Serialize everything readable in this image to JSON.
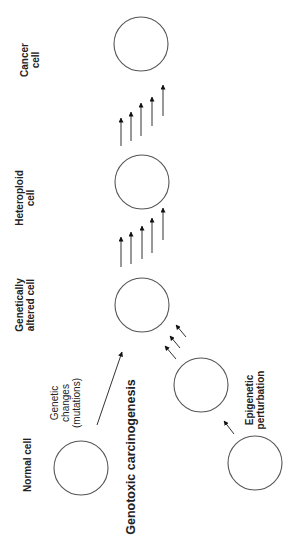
{
  "diagram": {
    "title": "Genotoxic carcinogenesis",
    "cells": [
      {
        "id": "normal",
        "label_lines": [
          "Normal cell"
        ],
        "cx": 81,
        "cy": 468,
        "r": 27
      },
      {
        "id": "genetically-altered",
        "label_lines": [
          "Genetically",
          "altered cell"
        ],
        "cx": 142,
        "cy": 305,
        "r": 27
      },
      {
        "id": "heteroploid",
        "label_lines": [
          "Heteroploid",
          "cell"
        ],
        "cx": 142,
        "cy": 182,
        "r": 27
      },
      {
        "id": "cancer",
        "label_lines": [
          "Cancer",
          "cell"
        ],
        "cx": 141,
        "cy": 44,
        "r": 27
      },
      {
        "id": "epigenetic-intermediate",
        "label_lines": [],
        "cx": 201,
        "cy": 385,
        "r": 27
      },
      {
        "id": "epigenetic-origin",
        "label_lines": [],
        "cx": 255,
        "cy": 463,
        "r": 27
      }
    ],
    "annotations": {
      "genetic_changes": [
        "Genetic",
        "changes",
        "(mutations)"
      ],
      "epigenetic_perturbation": [
        "Epigenetic",
        "perturbation"
      ]
    },
    "edges": [
      {
        "from": "normal",
        "to": "genetically-altered",
        "type": "single-long-arrow",
        "label": "Genetic changes (mutations)"
      },
      {
        "from": "epigenetic-origin",
        "to": "epigenetic-intermediate",
        "type": "single-arrow"
      },
      {
        "from": "epigenetic-intermediate",
        "to": "genetically-altered",
        "type": "triple-arrow",
        "label": "Epigenetic perturbation"
      },
      {
        "from": "genetically-altered",
        "to": "heteroploid",
        "type": "five-arrow"
      },
      {
        "from": "heteroploid",
        "to": "cancer",
        "type": "five-arrow"
      }
    ]
  }
}
